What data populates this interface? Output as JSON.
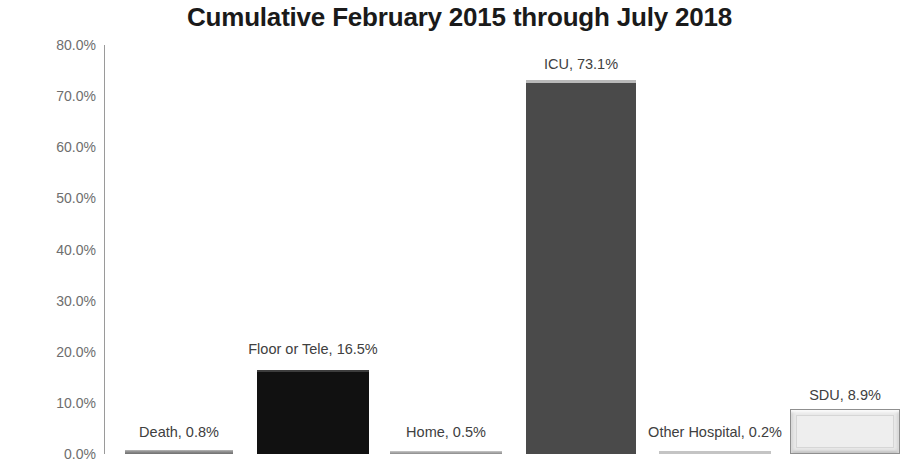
{
  "chart_data": {
    "type": "bar",
    "title": "Cumulative February 2015 through July 2018",
    "xlabel": "",
    "ylabel": "",
    "ylim": [
      0,
      80
    ],
    "grid": false,
    "legend": "none",
    "y_tick_labels": [
      "80.0%",
      "70.0%",
      "60.0%",
      "50.0%",
      "40.0%",
      "30.0%",
      "20.0%",
      "10.0%",
      "0.0%"
    ],
    "y_tick_values": [
      80,
      70,
      60,
      50,
      40,
      30,
      20,
      10,
      0
    ],
    "categories": [
      "Death",
      "Floor or Tele",
      "Home",
      "ICU",
      "Other Hospital",
      "SDU"
    ],
    "values": [
      0.8,
      16.5,
      0.5,
      73.1,
      0.2,
      8.9
    ],
    "data_labels": [
      "Death, 0.8%",
      "Floor or Tele, 16.5%",
      "Home, 0.5%",
      "ICU, 73.1%",
      "Other Hospital, 0.2%",
      "SDU, 8.9%"
    ],
    "bars": [
      {
        "category": "Death",
        "value": 0.8,
        "label": "Death, 0.8%",
        "color": "#8d8d8d",
        "style": "thin-grey",
        "x": 125,
        "width": 108,
        "label_cx": 179,
        "label_y": 424
      },
      {
        "category": "Floor or Tele",
        "value": 16.5,
        "label": "Floor or Tele, 16.5%",
        "color": "#111111",
        "style": "black",
        "x": 257,
        "width": 112,
        "label_cx": 313,
        "label_y": 341
      },
      {
        "category": "Home",
        "value": 0.5,
        "label": "Home, 0.5%",
        "color": "#a2a2a2",
        "style": "thin-light",
        "x": 390,
        "width": 112,
        "label_cx": 446,
        "label_y": 424
      },
      {
        "category": "ICU",
        "value": 73.1,
        "label": "ICU, 73.1%",
        "color": "#4a4a4a",
        "style": "darkgrey",
        "x": 526,
        "width": 110,
        "label_cx": 581,
        "label_y": 56
      },
      {
        "category": "Other Hospital",
        "value": 0.2,
        "label": "Other Hospital, 0.2%",
        "color": "#c4c4c4",
        "style": "hairline",
        "x": 659,
        "width": 112,
        "label_cx": 715,
        "label_y": 424
      },
      {
        "category": "SDU",
        "value": 8.9,
        "label": "SDU, 8.9%",
        "color": "#e9e9e9",
        "style": "bevel",
        "x": 790,
        "width": 110,
        "label_cx": 845,
        "label_y": 387
      }
    ],
    "axis_color": "#9a9a9a",
    "tick_label_color": "#6e6e6e",
    "title_color": "#1a1a1a",
    "background": "#ffffff"
  }
}
